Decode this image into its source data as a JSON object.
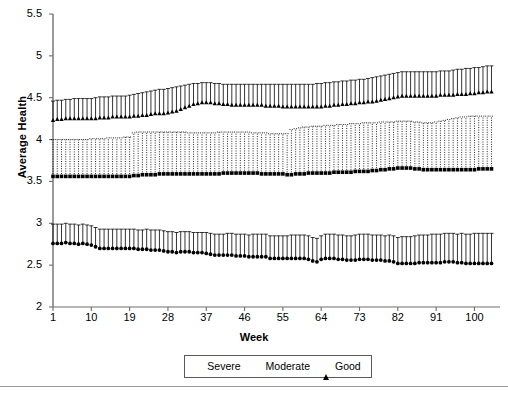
{
  "chart_data": {
    "type": "line",
    "title": "",
    "subtitle": "",
    "xlabel": "Week",
    "ylabel": "Average Health",
    "xlim": [
      1,
      106
    ],
    "ylim": [
      2,
      5.5
    ],
    "yticks": [
      "2",
      "2.5",
      "3",
      "3.5",
      "4",
      "4.5",
      "5",
      "5.5"
    ],
    "ytick_values": [
      2,
      2.5,
      3,
      3.5,
      4,
      4.5,
      5,
      5.5
    ],
    "xticks": [
      "1",
      "10",
      "19",
      "28",
      "37",
      "46",
      "55",
      "64",
      "73",
      "82",
      "91",
      "100"
    ],
    "xtick_values": [
      1,
      10,
      19,
      28,
      37,
      46,
      55,
      64,
      73,
      82,
      91,
      100
    ],
    "grid": false,
    "legend_position": "below-axis-center",
    "error_bars": "upper-only",
    "x": [
      1,
      2,
      3,
      4,
      5,
      6,
      7,
      8,
      9,
      10,
      11,
      12,
      13,
      14,
      15,
      16,
      17,
      18,
      19,
      20,
      21,
      22,
      23,
      24,
      25,
      26,
      27,
      28,
      29,
      30,
      31,
      32,
      33,
      34,
      35,
      36,
      37,
      38,
      39,
      40,
      41,
      42,
      43,
      44,
      45,
      46,
      47,
      48,
      49,
      50,
      51,
      52,
      53,
      54,
      55,
      56,
      57,
      58,
      59,
      60,
      61,
      62,
      63,
      64,
      65,
      66,
      67,
      68,
      69,
      70,
      71,
      72,
      73,
      74,
      75,
      76,
      77,
      78,
      79,
      80,
      81,
      82,
      83,
      84,
      85,
      86,
      87,
      88,
      89,
      90,
      91,
      92,
      93,
      94,
      95,
      96,
      97,
      98,
      99,
      100,
      101,
      102,
      103,
      104
    ],
    "series": [
      {
        "name": "Severe",
        "marker": "circle",
        "errorbar_style": "solid",
        "values": [
          2.76,
          2.76,
          2.76,
          2.77,
          2.76,
          2.76,
          2.75,
          2.76,
          2.75,
          2.74,
          2.72,
          2.7,
          2.7,
          2.7,
          2.7,
          2.7,
          2.7,
          2.7,
          2.7,
          2.7,
          2.69,
          2.69,
          2.69,
          2.68,
          2.68,
          2.68,
          2.67,
          2.66,
          2.66,
          2.65,
          2.66,
          2.66,
          2.66,
          2.65,
          2.65,
          2.65,
          2.64,
          2.63,
          2.62,
          2.62,
          2.62,
          2.62,
          2.62,
          2.61,
          2.61,
          2.61,
          2.6,
          2.6,
          2.6,
          2.6,
          2.6,
          2.58,
          2.58,
          2.58,
          2.58,
          2.58,
          2.58,
          2.58,
          2.58,
          2.58,
          2.57,
          2.55,
          2.54,
          2.57,
          2.58,
          2.58,
          2.58,
          2.57,
          2.57,
          2.56,
          2.56,
          2.56,
          2.57,
          2.57,
          2.57,
          2.56,
          2.56,
          2.56,
          2.55,
          2.55,
          2.54,
          2.52,
          2.52,
          2.52,
          2.52,
          2.52,
          2.53,
          2.53,
          2.53,
          2.53,
          2.53,
          2.53,
          2.54,
          2.54,
          2.54,
          2.53,
          2.53,
          2.52,
          2.52,
          2.52,
          2.52,
          2.52,
          2.52,
          2.52
        ],
        "upper": [
          2.99,
          2.99,
          2.99,
          3.0,
          2.99,
          2.99,
          2.98,
          2.99,
          2.98,
          2.97,
          2.95,
          2.93,
          2.93,
          2.93,
          2.93,
          2.93,
          2.93,
          2.93,
          2.93,
          2.93,
          2.92,
          2.92,
          2.93,
          2.92,
          2.92,
          2.92,
          2.91,
          2.9,
          2.9,
          2.89,
          2.9,
          2.9,
          2.9,
          2.89,
          2.89,
          2.89,
          2.89,
          2.88,
          2.87,
          2.87,
          2.87,
          2.88,
          2.88,
          2.87,
          2.87,
          2.87,
          2.86,
          2.87,
          2.87,
          2.87,
          2.87,
          2.85,
          2.85,
          2.85,
          2.85,
          2.85,
          2.86,
          2.86,
          2.86,
          2.86,
          2.85,
          2.83,
          2.82,
          2.85,
          2.87,
          2.87,
          2.87,
          2.86,
          2.86,
          2.85,
          2.85,
          2.86,
          2.87,
          2.87,
          2.87,
          2.86,
          2.86,
          2.86,
          2.85,
          2.86,
          2.85,
          2.83,
          2.84,
          2.84,
          2.84,
          2.85,
          2.86,
          2.86,
          2.86,
          2.87,
          2.87,
          2.87,
          2.88,
          2.88,
          2.88,
          2.87,
          2.88,
          2.87,
          2.87,
          2.88,
          2.88,
          2.88,
          2.88,
          2.88
        ]
      },
      {
        "name": "Moderate",
        "marker": "square",
        "errorbar_style": "dotted",
        "values": [
          3.56,
          3.56,
          3.56,
          3.56,
          3.56,
          3.56,
          3.56,
          3.56,
          3.56,
          3.56,
          3.56,
          3.56,
          3.56,
          3.56,
          3.56,
          3.56,
          3.56,
          3.56,
          3.56,
          3.57,
          3.57,
          3.58,
          3.58,
          3.58,
          3.58,
          3.59,
          3.59,
          3.59,
          3.59,
          3.59,
          3.59,
          3.59,
          3.59,
          3.59,
          3.59,
          3.59,
          3.59,
          3.59,
          3.59,
          3.59,
          3.6,
          3.6,
          3.6,
          3.6,
          3.6,
          3.6,
          3.6,
          3.6,
          3.6,
          3.59,
          3.59,
          3.59,
          3.59,
          3.59,
          3.59,
          3.58,
          3.58,
          3.59,
          3.59,
          3.59,
          3.6,
          3.6,
          3.6,
          3.6,
          3.6,
          3.6,
          3.61,
          3.61,
          3.61,
          3.61,
          3.61,
          3.62,
          3.62,
          3.62,
          3.62,
          3.63,
          3.63,
          3.64,
          3.64,
          3.65,
          3.65,
          3.66,
          3.66,
          3.66,
          3.66,
          3.65,
          3.65,
          3.64,
          3.64,
          3.64,
          3.64,
          3.64,
          3.64,
          3.64,
          3.64,
          3.64,
          3.64,
          3.64,
          3.64,
          3.64,
          3.65,
          3.65,
          3.65,
          3.65
        ],
        "upper": [
          4.0,
          4.0,
          4.0,
          4.0,
          4.0,
          4.0,
          4.0,
          4.0,
          4.0,
          4.01,
          4.01,
          4.01,
          4.01,
          4.02,
          4.02,
          4.02,
          4.02,
          4.03,
          4.03,
          4.08,
          4.09,
          4.09,
          4.09,
          4.09,
          4.09,
          4.09,
          4.09,
          4.09,
          4.09,
          4.09,
          4.09,
          4.09,
          4.08,
          4.08,
          4.08,
          4.08,
          4.08,
          4.08,
          4.08,
          4.09,
          4.09,
          4.09,
          4.09,
          4.09,
          4.09,
          4.09,
          4.09,
          4.08,
          4.08,
          4.08,
          4.08,
          4.07,
          4.07,
          4.07,
          4.07,
          4.07,
          4.12,
          4.13,
          4.14,
          4.15,
          4.15,
          4.16,
          4.16,
          4.16,
          4.17,
          4.17,
          4.17,
          4.18,
          4.18,
          4.18,
          4.19,
          4.19,
          4.19,
          4.2,
          4.2,
          4.2,
          4.2,
          4.21,
          4.21,
          4.21,
          4.21,
          4.22,
          4.22,
          4.22,
          4.22,
          4.21,
          4.21,
          4.2,
          4.2,
          4.2,
          4.21,
          4.22,
          4.23,
          4.24,
          4.25,
          4.26,
          4.27,
          4.27,
          4.28,
          4.28,
          4.28,
          4.28,
          4.28,
          4.28
        ]
      },
      {
        "name": "Good",
        "marker": "triangle",
        "errorbar_style": "solid",
        "values": [
          4.23,
          4.24,
          4.24,
          4.25,
          4.25,
          4.25,
          4.25,
          4.25,
          4.25,
          4.25,
          4.25,
          4.26,
          4.26,
          4.26,
          4.27,
          4.27,
          4.27,
          4.27,
          4.27,
          4.28,
          4.28,
          4.29,
          4.29,
          4.3,
          4.31,
          4.31,
          4.31,
          4.32,
          4.33,
          4.34,
          4.36,
          4.38,
          4.4,
          4.42,
          4.43,
          4.44,
          4.44,
          4.44,
          4.43,
          4.43,
          4.42,
          4.42,
          4.41,
          4.41,
          4.41,
          4.41,
          4.41,
          4.41,
          4.41,
          4.41,
          4.4,
          4.4,
          4.4,
          4.4,
          4.39,
          4.39,
          4.39,
          4.39,
          4.39,
          4.39,
          4.39,
          4.39,
          4.39,
          4.39,
          4.4,
          4.4,
          4.41,
          4.41,
          4.42,
          4.42,
          4.43,
          4.43,
          4.44,
          4.44,
          4.45,
          4.45,
          4.46,
          4.47,
          4.48,
          4.49,
          4.5,
          4.51,
          4.52,
          4.52,
          4.52,
          4.52,
          4.52,
          4.52,
          4.52,
          4.52,
          4.52,
          4.53,
          4.53,
          4.53,
          4.53,
          4.54,
          4.54,
          4.54,
          4.55,
          4.55,
          4.56,
          4.56,
          4.57,
          4.57
        ],
        "upper": [
          4.46,
          4.47,
          4.47,
          4.48,
          4.48,
          4.49,
          4.49,
          4.49,
          4.49,
          4.49,
          4.5,
          4.51,
          4.51,
          4.51,
          4.52,
          4.52,
          4.52,
          4.52,
          4.53,
          4.54,
          4.55,
          4.56,
          4.57,
          4.58,
          4.59,
          4.6,
          4.6,
          4.61,
          4.62,
          4.63,
          4.64,
          4.65,
          4.66,
          4.67,
          4.67,
          4.68,
          4.68,
          4.68,
          4.67,
          4.67,
          4.66,
          4.66,
          4.66,
          4.66,
          4.66,
          4.66,
          4.66,
          4.66,
          4.66,
          4.66,
          4.66,
          4.66,
          4.66,
          4.66,
          4.66,
          4.66,
          4.66,
          4.66,
          4.66,
          4.66,
          4.66,
          4.66,
          4.67,
          4.67,
          4.68,
          4.68,
          4.69,
          4.69,
          4.7,
          4.7,
          4.71,
          4.71,
          4.72,
          4.72,
          4.73,
          4.74,
          4.75,
          4.76,
          4.77,
          4.78,
          4.79,
          4.8,
          4.81,
          4.81,
          4.81,
          4.81,
          4.81,
          4.81,
          4.81,
          4.81,
          4.81,
          4.82,
          4.82,
          4.82,
          4.83,
          4.84,
          4.84,
          4.85,
          4.85,
          4.86,
          4.86,
          4.87,
          4.88,
          4.88
        ]
      }
    ]
  },
  "legend": {
    "entries": [
      {
        "label": "Severe",
        "marker": "circle"
      },
      {
        "label": "Moderate",
        "marker": "square"
      },
      {
        "label": "Good",
        "marker": "triangle"
      }
    ]
  },
  "colors": {
    "series": "#000000",
    "axis": "#6f6f6f",
    "legend_border": "#5a5a5a",
    "rule": "#9a9a9a",
    "background": "#ffffff"
  }
}
